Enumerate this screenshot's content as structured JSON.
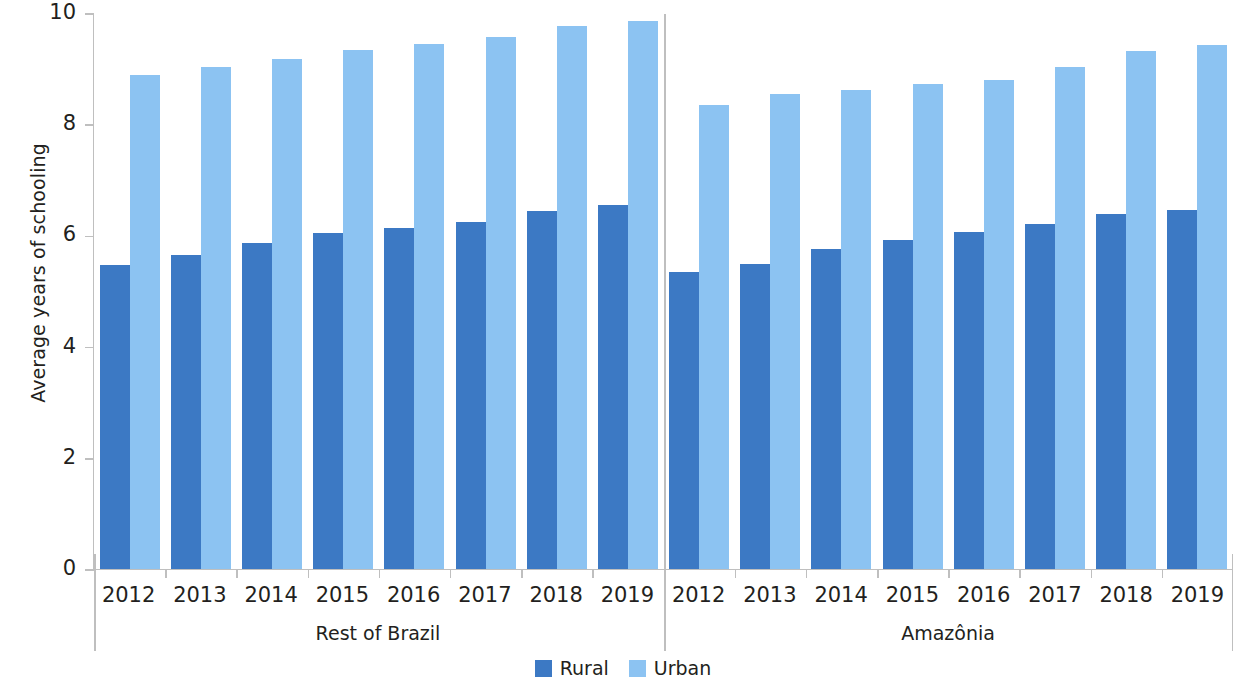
{
  "chart_data": {
    "type": "bar",
    "title": "",
    "subtitle": "",
    "xlabel": "",
    "ylabel": "Average years of schooling",
    "ylim": [
      0,
      10
    ],
    "ytick_labels": [
      "10",
      "8",
      "6",
      "4",
      "2",
      "0"
    ],
    "ytick_values": [
      10,
      8,
      6,
      4,
      2,
      0
    ],
    "grid": false,
    "legend_position": "bottom-center",
    "legend": [
      "Rural",
      "Urban"
    ],
    "categories": [
      "2012",
      "2013",
      "2014",
      "2015",
      "2016",
      "2017",
      "2018",
      "2019"
    ],
    "groups": [
      {
        "name": "Rest of Brazil",
        "categories": [
          "2012",
          "2013",
          "2014",
          "2015",
          "2016",
          "2017",
          "2018",
          "2019"
        ],
        "series": [
          {
            "name": "Rural",
            "color": "#3c79c4",
            "values": [
              5.47,
              5.64,
              5.87,
              6.04,
              6.13,
              6.24,
              6.44,
              6.55
            ]
          },
          {
            "name": "Urban",
            "color": "#8cc3f2",
            "values": [
              8.88,
              9.03,
              9.18,
              9.33,
              9.45,
              9.56,
              9.76,
              9.86
            ]
          }
        ]
      },
      {
        "name": "Amazônia",
        "categories": [
          "2012",
          "2013",
          "2014",
          "2015",
          "2016",
          "2017",
          "2018",
          "2019"
        ],
        "series": [
          {
            "name": "Rural",
            "color": "#3c79c4",
            "values": [
              5.34,
              5.48,
              5.75,
              5.92,
              6.07,
              6.21,
              6.39,
              6.45
            ]
          },
          {
            "name": "Urban",
            "color": "#8cc3f2",
            "values": [
              8.35,
              8.55,
              8.62,
              8.72,
              8.79,
              9.03,
              9.31,
              9.43
            ]
          }
        ]
      }
    ]
  },
  "axis": {
    "y_title": "Average years of schooling"
  },
  "legend": {
    "items": [
      {
        "label": "Rural",
        "color": "#3c79c4"
      },
      {
        "label": "Urban",
        "color": "#8cc3f2"
      }
    ]
  },
  "colors": {
    "rural": "#3c79c4",
    "urban": "#8cc3f2",
    "axis": "#bfbfbf",
    "text": "#231f20",
    "background": "#ffffff"
  }
}
